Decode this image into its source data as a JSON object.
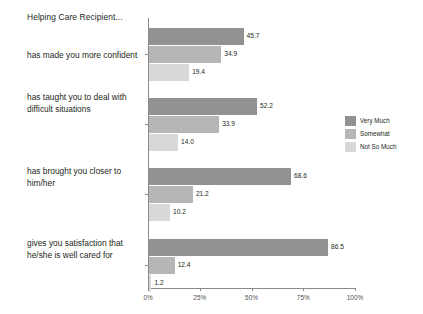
{
  "chart_data": {
    "type": "bar",
    "orientation": "horizontal",
    "title": "Helping Care Recipient...",
    "xlabel": "",
    "ylabel": "",
    "xlim": [
      0,
      100
    ],
    "xticks": [
      "0%",
      "25%",
      "50%",
      "75%",
      "100%"
    ],
    "xtick_values": [
      0,
      25,
      50,
      75,
      100
    ],
    "grid": false,
    "legend_position": "right",
    "categories": [
      "has made you more confident",
      "has taught you to deal with difficult situations",
      "has brought you closer to him/her",
      "gives you satisfaction that he/she is well cared for"
    ],
    "series": [
      {
        "name": "Very Much",
        "color": "#929292",
        "values": [
          45.7,
          52.2,
          68.6,
          86.5
        ],
        "labels": [
          "45.7",
          "52.2",
          "68.6",
          "86.5"
        ]
      },
      {
        "name": "Somewhat",
        "color": "#b6b6b6",
        "values": [
          34.9,
          33.9,
          21.2,
          12.4
        ],
        "labels": [
          "34.9",
          "33.9",
          "21.2",
          "12.4"
        ]
      },
      {
        "name": "Not So Much",
        "color": "#d8d8d8",
        "values": [
          19.4,
          14.0,
          10.2,
          1.2
        ],
        "labels": [
          "19.4",
          "14.0",
          "10.2",
          "1.2"
        ]
      }
    ]
  },
  "legend": {
    "items": [
      {
        "label": "Very Much",
        "color": "#929292"
      },
      {
        "label": "Somewhat",
        "color": "#b6b6b6"
      },
      {
        "label": "Not So Much",
        "color": "#d8d8d8"
      }
    ]
  },
  "axis": {
    "axis_color": "#8a8a8a"
  }
}
